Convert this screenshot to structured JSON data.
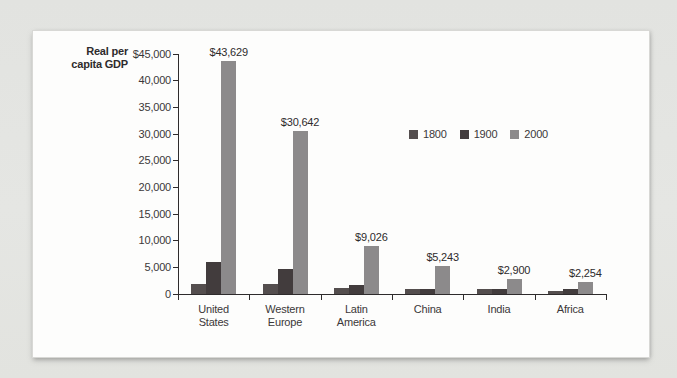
{
  "page": {
    "background": "#e3e4e1",
    "panel_background": "#fdfdfc",
    "axis_color": "#2e2b2c",
    "text_color": "#3b3839"
  },
  "chart_data": {
    "type": "bar",
    "title": "",
    "ylabel": "Real per capita GDP",
    "ylabel_lines": [
      "Real per",
      "capita GDP"
    ],
    "xlabel": "",
    "categories": [
      "United States",
      "Western Europe",
      "Latin America",
      "China",
      "India",
      "Africa"
    ],
    "series": [
      {
        "name": "1800",
        "color": "#544e4e",
        "values": [
          1950,
          1900,
          1150,
          950,
          900,
          650
        ]
      },
      {
        "name": "1900",
        "color": "#423c3d",
        "values": [
          6000,
          4700,
          1700,
          950,
          950,
          850
        ]
      },
      {
        "name": "2000",
        "color": "#8c8a8b",
        "values": [
          43629,
          30642,
          9026,
          5243,
          2900,
          2254
        ],
        "value_labels": [
          "$43,629",
          "$30,642",
          "$9,026",
          "$5,243",
          "$2,900",
          "$2,254"
        ]
      }
    ],
    "ylim": [
      0,
      45000
    ],
    "yticks": [
      {
        "value": 45000,
        "label": "$45,000"
      },
      {
        "value": 40000,
        "label": "40,000"
      },
      {
        "value": 35000,
        "label": "35,000"
      },
      {
        "value": 30000,
        "label": "30,000"
      },
      {
        "value": 25000,
        "label": "25,000"
      },
      {
        "value": 20000,
        "label": "20,000"
      },
      {
        "value": 15000,
        "label": "15,000"
      },
      {
        "value": 10000,
        "label": "10,000"
      },
      {
        "value": 5000,
        "label": "5,000"
      },
      {
        "value": 0,
        "label": "0"
      }
    ],
    "grid": false,
    "legend_position": "center-right"
  }
}
